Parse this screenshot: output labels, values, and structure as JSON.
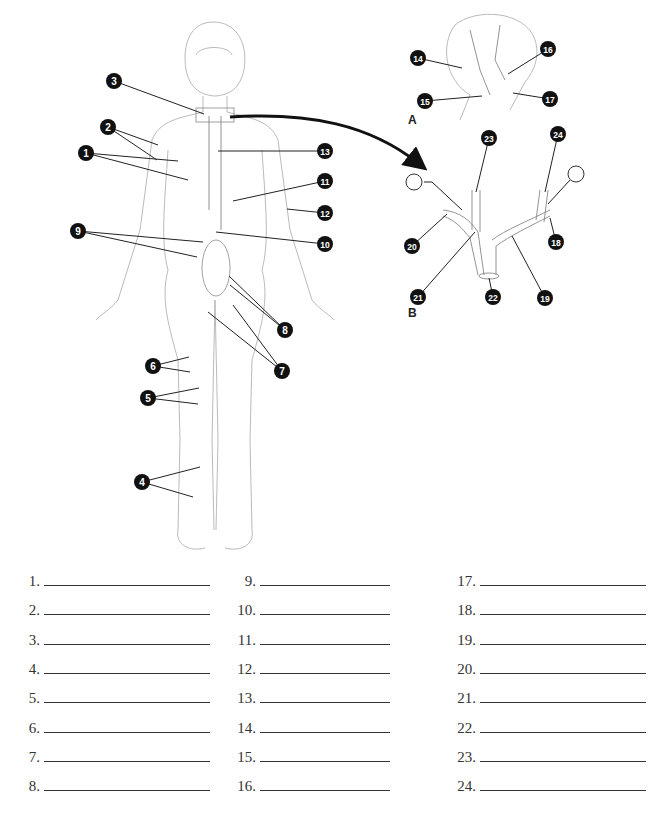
{
  "figure": {
    "panel_labels": [
      {
        "id": "A",
        "text": "A",
        "x": 408,
        "y": 125
      },
      {
        "id": "B",
        "text": "B",
        "x": 408,
        "y": 318
      }
    ],
    "callouts": [
      {
        "n": "1",
        "cx": 86,
        "cy": 153,
        "targets": [
          [
            178,
            161
          ],
          [
            188,
            180
          ]
        ]
      },
      {
        "n": "2",
        "cx": 108,
        "cy": 127,
        "targets": [
          [
            158,
            145
          ],
          [
            157,
            160
          ]
        ]
      },
      {
        "n": "3",
        "cx": 114,
        "cy": 81,
        "targets": [
          [
            204,
            114
          ]
        ]
      },
      {
        "n": "4",
        "cx": 142,
        "cy": 482,
        "targets": [
          [
            200,
            467
          ],
          [
            193,
            497
          ]
        ]
      },
      {
        "n": "5",
        "cx": 148,
        "cy": 398,
        "targets": [
          [
            199,
            388
          ],
          [
            198,
            404
          ]
        ]
      },
      {
        "n": "6",
        "cx": 153,
        "cy": 366,
        "targets": [
          [
            189,
            357
          ],
          [
            190,
            372
          ]
        ]
      },
      {
        "n": "7",
        "cx": 282,
        "cy": 371,
        "targets": [
          [
            208,
            312
          ],
          [
            233,
            305
          ]
        ]
      },
      {
        "n": "8",
        "cx": 285,
        "cy": 330,
        "targets": [
          [
            229,
            276
          ],
          [
            230,
            285
          ]
        ]
      },
      {
        "n": "9",
        "cx": 78,
        "cy": 231,
        "targets": [
          [
            203,
            242
          ],
          [
            197,
            257
          ]
        ]
      },
      {
        "n": "10",
        "cx": 325,
        "cy": 244,
        "targets": [
          [
            216,
            232
          ]
        ]
      },
      {
        "n": "11",
        "cx": 325,
        "cy": 181,
        "targets": [
          [
            233,
            201
          ]
        ]
      },
      {
        "n": "12",
        "cx": 325,
        "cy": 213,
        "targets": [
          [
            287,
            209
          ]
        ]
      },
      {
        "n": "13",
        "cx": 325,
        "cy": 151,
        "targets": [
          [
            218,
            151
          ]
        ]
      },
      {
        "n": "14",
        "cx": 418,
        "cy": 58,
        "targets": [
          [
            462,
            68
          ]
        ]
      },
      {
        "n": "15",
        "cx": 425,
        "cy": 101,
        "targets": [
          [
            482,
            96
          ]
        ]
      },
      {
        "n": "16",
        "cx": 548,
        "cy": 49,
        "targets": [
          [
            508,
            74
          ]
        ]
      },
      {
        "n": "17",
        "cx": 550,
        "cy": 99,
        "targets": [
          [
            513,
            93
          ]
        ]
      },
      {
        "n": "18",
        "cx": 556,
        "cy": 242,
        "targets": [
          [
            550,
            218
          ]
        ]
      },
      {
        "n": "19",
        "cx": 545,
        "cy": 298,
        "targets": [
          [
            512,
            236
          ]
        ]
      },
      {
        "n": "20",
        "cx": 412,
        "cy": 246,
        "targets": [
          [
            447,
            214
          ]
        ]
      },
      {
        "n": "21",
        "cx": 418,
        "cy": 297,
        "targets": [
          [
            475,
            232
          ]
        ]
      },
      {
        "n": "22",
        "cx": 493,
        "cy": 297,
        "targets": [
          [
            489,
            278
          ]
        ]
      },
      {
        "n": "23",
        "cx": 489,
        "cy": 138,
        "targets": [
          [
            476,
            192
          ]
        ]
      },
      {
        "n": "24",
        "cx": 558,
        "cy": 134,
        "targets": [
          [
            545,
            192
          ]
        ]
      }
    ],
    "blank_circles": [
      {
        "cx": 414,
        "cy": 182,
        "r": 8,
        "lead": [
          [
            424,
            182
          ],
          [
            432,
            182
          ],
          [
            462,
            210
          ]
        ]
      },
      {
        "cx": 576,
        "cy": 174,
        "r": 8,
        "lead": [
          [
            570,
            180
          ],
          [
            548,
            204
          ]
        ]
      }
    ],
    "arrow": {
      "path": "M 230 117 C 310 112, 370 125, 418 163"
    },
    "callout_fill": "#111111",
    "line_color": "#222222",
    "sketch_color": "#9a9a9a"
  },
  "answers": {
    "columns": [
      {
        "x": 28,
        "num_width": 12,
        "line_width": 166,
        "items": [
          "1.",
          "2.",
          "3.",
          "4.",
          "5.",
          "6.",
          "7.",
          "8."
        ]
      },
      {
        "x": 232,
        "num_width": 24,
        "line_width": 130,
        "items": [
          "9.",
          "10.",
          "11.",
          "12.",
          "13.",
          "14.",
          "15.",
          "16."
        ]
      },
      {
        "x": 454,
        "num_width": 22,
        "line_width": 166,
        "items": [
          "17.",
          "18.",
          "19.",
          "20.",
          "21.",
          "22.",
          "23.",
          "24."
        ]
      }
    ],
    "row_start": 8,
    "row_step": 29.3
  }
}
